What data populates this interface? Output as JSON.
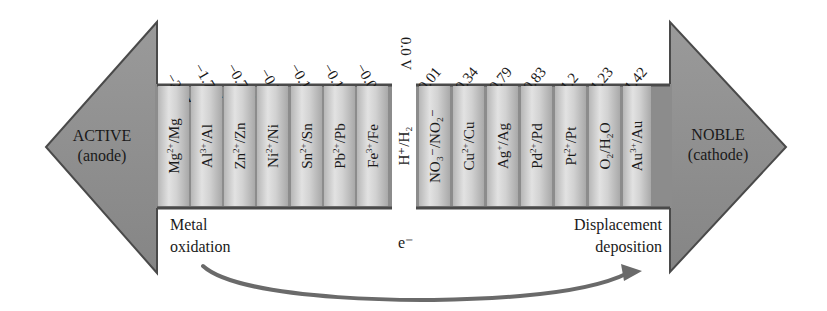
{
  "diagram": {
    "left_arrow": {
      "title": "ACTIVE",
      "subtitle": "(anode)"
    },
    "right_arrow": {
      "title": "NOBLE",
      "subtitle": "(cathode)"
    },
    "reference": {
      "potential": "0.0 V",
      "couple": "H⁺/H₂"
    },
    "anodic_couples": [
      {
        "potential": "−2.37",
        "ion": "Mg",
        "charge": "2+",
        "metal": "/Mg"
      },
      {
        "potential": "−1.706",
        "ion": "Al",
        "charge": "3+",
        "metal": "/Al"
      },
      {
        "potential": "−0.763",
        "ion": "Zn",
        "charge": "2+",
        "metal": "/Zn"
      },
      {
        "potential": "−0.23",
        "ion": "Ni",
        "charge": "2+",
        "metal": "/Ni"
      },
      {
        "potential": "−0.136",
        "ion": "Sn",
        "charge": "2+",
        "metal": "/Sn"
      },
      {
        "potential": "−0.126",
        "ion": "Pb",
        "charge": "2+",
        "metal": "/Pb"
      },
      {
        "potential": "−0.036",
        "ion": "Fe",
        "charge": "3+",
        "metal": "/Fe"
      }
    ],
    "cathodic_couples": [
      {
        "potential": "0.01",
        "label": "NO₃⁻/NO₂⁻"
      },
      {
        "potential": "0.34",
        "ion": "Cu",
        "charge": "2+",
        "metal": "/Cu"
      },
      {
        "potential": "0.79",
        "ion": "Ag",
        "charge": "+",
        "metal": "/Ag"
      },
      {
        "potential": "0.83",
        "ion": "Pd",
        "charge": "2+",
        "metal": "/Pd"
      },
      {
        "potential": "1.2",
        "ion": "Pt",
        "charge": "2+",
        "metal": "/Pt"
      },
      {
        "potential": "1.23",
        "label": "O₂/H₂O"
      },
      {
        "potential": "1.42",
        "ion": "Au",
        "charge": "3+",
        "metal": "/Au"
      }
    ],
    "notes": {
      "left_line1": "Metal",
      "left_line2": "oxidation",
      "electron": "e⁻",
      "right_line1": "Displacement",
      "right_line2": "deposition"
    },
    "colors": {
      "arrow_fill": "#8c8c8c",
      "arrow_edge": "#4a4a4a",
      "column_light": "#e2e2e2",
      "column_dark": "#a9a9a9"
    }
  }
}
